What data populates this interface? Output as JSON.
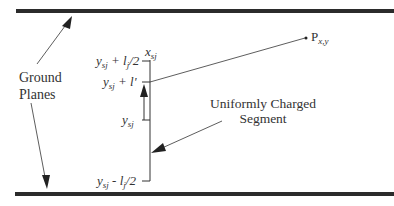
{
  "diagram": {
    "ground_planes_label_line1": "Ground",
    "ground_planes_label_line2": "Planes",
    "segment_label_line1": "Uniformly Charged",
    "segment_label_line2": "Segment",
    "x_label": "x",
    "x_label_sub": "sj",
    "top_label_y": "y",
    "top_label_sub": "sj",
    "top_label_rest": " + l",
    "top_label_sub2": "j",
    "top_label_tail": "/2",
    "mid_label_y": "y",
    "mid_label_sub": "sj",
    "mid_label_rest": " + l'",
    "center_label_y": "y",
    "center_label_sub": "sj",
    "bottom_label_y": "y",
    "bottom_label_sub": "sj",
    "bottom_label_rest": " - l",
    "bottom_label_sub2": "j",
    "bottom_label_tail": "/2",
    "point_label": "P",
    "point_label_sub": "x,y",
    "line_color": "#2a2a2a"
  }
}
